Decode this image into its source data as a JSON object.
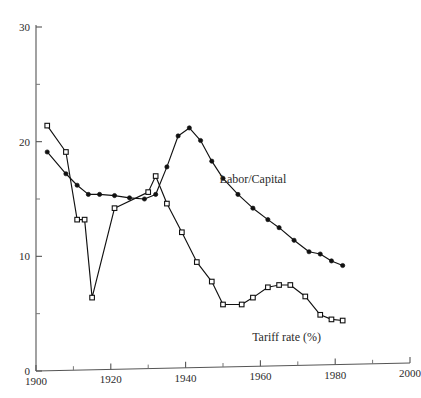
{
  "chart_data": {
    "type": "line",
    "title": "",
    "subtitle": "",
    "xlabel": "",
    "ylabel": "",
    "xlim": [
      1900,
      2000
    ],
    "ylim": [
      0,
      30
    ],
    "grid": false,
    "legend_position": "inline-annotation",
    "x_ticks_major": [
      1900,
      1920,
      1940,
      1960,
      1980,
      2000
    ],
    "x_ticks_minor": [
      1910,
      1930,
      1950,
      1970,
      1990
    ],
    "y_ticks_major": [
      0,
      10,
      20,
      30
    ],
    "y_ticks_minor": [
      5,
      15,
      25
    ],
    "x_tick_labels": [
      "1900",
      "1920",
      "1940",
      "1960",
      "1980",
      "2000"
    ],
    "y_tick_labels": [
      "0",
      "10",
      "20",
      "30"
    ],
    "annotations": [
      {
        "text": "Labor/Capital",
        "x": 1958,
        "y": 16.4
      },
      {
        "text": "Tariff rate (%)",
        "x": 1967,
        "y": 2.6
      }
    ],
    "series": [
      {
        "name": "Tariff rate (%)",
        "marker": "open-square",
        "x": [
          1903,
          1908,
          1911,
          1913,
          1915,
          1921,
          1930,
          1932,
          1935,
          1939,
          1943,
          1947,
          1950,
          1955,
          1958,
          1962,
          1965,
          1968,
          1972,
          1976,
          1979,
          1982
        ],
        "values": [
          21.4,
          19.1,
          13.2,
          13.2,
          6.4,
          14.2,
          15.6,
          17.0,
          14.6,
          12.1,
          9.5,
          7.8,
          5.8,
          5.8,
          6.4,
          7.3,
          7.5,
          7.5,
          6.5,
          4.9,
          4.5,
          4.4
        ]
      },
      {
        "name": "Labor/Capital",
        "marker": "filled-circle",
        "x": [
          1903,
          1908,
          1911,
          1914,
          1917,
          1921,
          1925,
          1929,
          1932,
          1935,
          1938,
          1941,
          1944,
          1947,
          1950,
          1954,
          1958,
          1962,
          1965,
          1969,
          1973,
          1976,
          1979,
          1982
        ],
        "values": [
          19.1,
          17.2,
          16.2,
          15.4,
          15.4,
          15.3,
          15.1,
          15.0,
          15.4,
          17.8,
          20.5,
          21.2,
          20.1,
          18.3,
          16.8,
          15.4,
          14.2,
          13.2,
          12.5,
          11.4,
          10.4,
          10.2,
          9.6,
          9.2
        ]
      }
    ]
  }
}
